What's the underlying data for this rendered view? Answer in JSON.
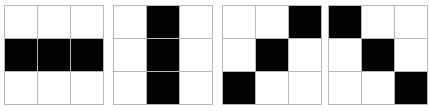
{
  "figure": {
    "type": "binary-grid-set",
    "grid_rows": 3,
    "grid_cols": 3,
    "colors": {
      "filled": "#000000",
      "empty": "#ffffff",
      "gridline": "#b8b8b8",
      "background": "#ffffff"
    },
    "grids": [
      {
        "name": "horizontal-bar",
        "cells": [
          [
            0,
            0,
            0
          ],
          [
            1,
            1,
            1
          ],
          [
            0,
            0,
            0
          ]
        ]
      },
      {
        "name": "vertical-bar",
        "cells": [
          [
            0,
            1,
            0
          ],
          [
            0,
            1,
            0
          ],
          [
            0,
            1,
            0
          ]
        ]
      },
      {
        "name": "anti-diagonal",
        "cells": [
          [
            0,
            0,
            1
          ],
          [
            0,
            1,
            0
          ],
          [
            1,
            0,
            0
          ]
        ]
      },
      {
        "name": "main-diagonal",
        "cells": [
          [
            1,
            0,
            0
          ],
          [
            0,
            1,
            0
          ],
          [
            0,
            0,
            1
          ]
        ]
      }
    ]
  }
}
